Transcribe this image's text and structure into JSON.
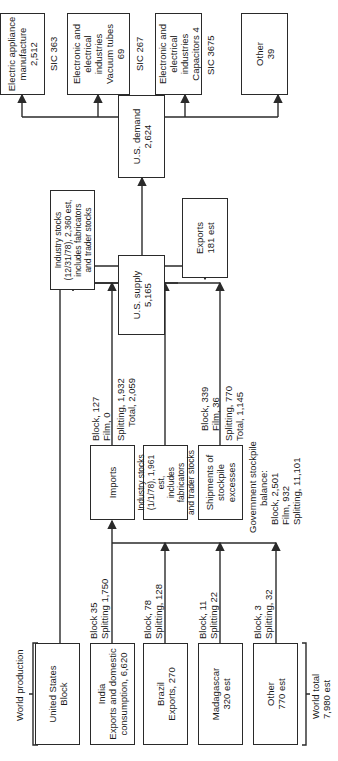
{
  "world_production": {
    "title": "World production",
    "sources": [
      {
        "name": "United States",
        "detail": "Block",
        "flow_line1": "",
        "flow_line2": ""
      },
      {
        "name": "India",
        "detail": "Exports and domestic consumption, 6,620",
        "flow_line1": "Block 35",
        "flow_line2": "Splitting 1,750"
      },
      {
        "name": "Brazil",
        "detail": "Exports, 270",
        "flow_line1": "Block, 78",
        "flow_line2": "Splitting, 128"
      },
      {
        "name": "Madagascar",
        "detail": "320 est",
        "flow_line1": "Block, 11",
        "flow_line2": "Splitting 22"
      },
      {
        "name": "Other",
        "detail": "770 est",
        "flow_line1": "Block, 3",
        "flow_line2": "Splitting, 32"
      }
    ],
    "world_total_label": "World total",
    "world_total_value": "7,980 est"
  },
  "imports": {
    "label": "Imports",
    "flow_line1": "Block, 127",
    "flow_line2": "Film, 0",
    "flow_line3": "Splitting, 1,932",
    "flow_line4": "Total, 2,059"
  },
  "industry_stocks_start": {
    "line1": "Industry stocks",
    "line2": "(1/1/78), 1,961 est,",
    "line3": "includes fabricators",
    "line4": "and trader stocks"
  },
  "stockpile_shipments": {
    "line1": "Shipments of",
    "line2": "stockpile",
    "line3": "excesses",
    "flow_line1": "Block, 339",
    "flow_line2": "Film, 36",
    "flow_line3": "Splitting, 770",
    "flow_line4": "Total, 1,145"
  },
  "government_stockpile": {
    "line1": "Government stockpile",
    "line2": "balance:",
    "line3": "Block, 2,501",
    "line4": "Film, 932",
    "line5": "Splitting, 11,101"
  },
  "us_supply": {
    "label": "U.S. supply",
    "value": "5,165"
  },
  "industry_stocks_end": {
    "line1": "Industry stocks",
    "line2": "(12/31/78), 2,360 est,",
    "line3": "includes fabricators",
    "line4": "and trader stocks"
  },
  "exports": {
    "label": "Exports",
    "value": "181 est"
  },
  "us_demand": {
    "label": "U.S. demand",
    "value": "2,624"
  },
  "end_uses": [
    {
      "line1": "Electric appliance",
      "line2": "manufacture",
      "line3": "2,512",
      "sic": "SIC 363"
    },
    {
      "line1": "Electronic and",
      "line2": "electrical",
      "line3": "industries",
      "line4": "Vacuum tubes",
      "line5": "69",
      "sic": "SIC 267"
    },
    {
      "line1": "Electronic and",
      "line2": "electrical",
      "line3": "industries",
      "line4": "Capacitors   4",
      "sic": "SIC 3675"
    },
    {
      "line1": "Other",
      "line2": "39"
    }
  ]
}
